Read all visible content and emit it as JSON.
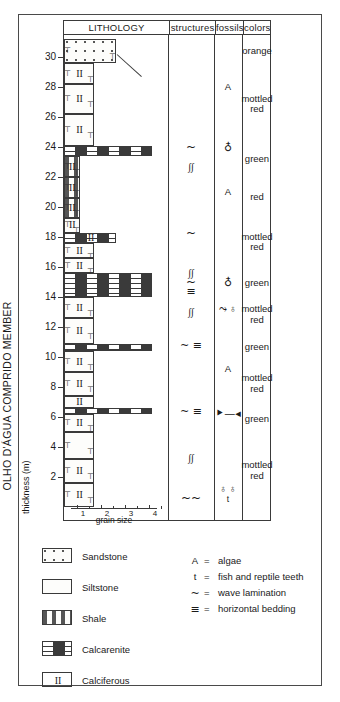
{
  "figure": {
    "member_name": "OLHO D'ÁGUA COMPRIDO MEMBER",
    "axis_title": "thickness (m)"
  },
  "table_headers": [
    {
      "id": "lithology",
      "label": "LITHOLOGY"
    },
    {
      "id": "structures",
      "label": "structures"
    },
    {
      "id": "fossils",
      "label": "fossils"
    },
    {
      "id": "colors",
      "label": "colors"
    }
  ],
  "depth_axis": {
    "unit": "m",
    "ticks": [
      2,
      4,
      6,
      8,
      10,
      12,
      14,
      16,
      18,
      20,
      22,
      24,
      26,
      28,
      30
    ],
    "min": 0,
    "max": 31.5
  },
  "grain_size_scale": {
    "caption": "grain size",
    "ticks": [
      "1",
      "2",
      "3",
      "4"
    ]
  },
  "chart_data": {
    "type": "table",
    "xlabel": "grain size",
    "ylabel": "thickness (m)",
    "ylim": [
      0,
      31.5
    ],
    "lithology_units": [
      {
        "from": 0.0,
        "to": 1.6,
        "lithology": "siltstone",
        "grain": 2,
        "calciferous": true
      },
      {
        "from": 1.6,
        "to": 3.2,
        "lithology": "siltstone",
        "grain": 2,
        "calciferous": true
      },
      {
        "from": 3.2,
        "to": 5.0,
        "lithology": "siltstone",
        "grain": 2,
        "calciferous": false
      },
      {
        "from": 5.0,
        "to": 6.2,
        "lithology": "siltstone",
        "grain": 2,
        "calciferous": true
      },
      {
        "from": 6.2,
        "to": 6.6,
        "lithology": "calcarenite",
        "grain": 4,
        "calciferous": false
      },
      {
        "from": 6.6,
        "to": 7.4,
        "lithology": "siltstone",
        "grain": 2,
        "calciferous": true
      },
      {
        "from": 7.4,
        "to": 9.0,
        "lithology": "siltstone",
        "grain": 2,
        "calciferous": true
      },
      {
        "from": 9.0,
        "to": 10.4,
        "lithology": "siltstone",
        "grain": 2,
        "calciferous": true
      },
      {
        "from": 10.4,
        "to": 10.9,
        "lithology": "calcarenite",
        "grain": 4,
        "calciferous": false
      },
      {
        "from": 10.9,
        "to": 12.6,
        "lithology": "siltstone",
        "grain": 2,
        "calciferous": true
      },
      {
        "from": 12.6,
        "to": 14.0,
        "lithology": "siltstone",
        "grain": 2,
        "calciferous": true
      },
      {
        "from": 14.0,
        "to": 15.6,
        "lithology": "calcarenite",
        "grain": 4,
        "calciferous": false
      },
      {
        "from": 15.6,
        "to": 16.6,
        "lithology": "siltstone",
        "grain": 2,
        "calciferous": true
      },
      {
        "from": 16.6,
        "to": 17.6,
        "lithology": "siltstone",
        "grain": 2,
        "calciferous": true
      },
      {
        "from": 17.6,
        "to": 18.3,
        "lithology": "calcarenite",
        "grain": 3,
        "calciferous": true
      },
      {
        "from": 18.3,
        "to": 19.3,
        "lithology": "siltstone",
        "grain": 1,
        "calciferous": true
      },
      {
        "from": 19.3,
        "to": 20.6,
        "lithology": "shale",
        "grain": 1,
        "calciferous": true
      },
      {
        "from": 20.6,
        "to": 22.0,
        "lithology": "shale",
        "grain": 1,
        "calciferous": true
      },
      {
        "from": 22.0,
        "to": 23.4,
        "lithology": "shale",
        "grain": 1,
        "calciferous": true
      },
      {
        "from": 23.4,
        "to": 24.1,
        "lithology": "calcarenite",
        "grain": 4,
        "calciferous": false
      },
      {
        "from": 24.1,
        "to": 26.2,
        "lithology": "siltstone",
        "grain": 2,
        "calciferous": true
      },
      {
        "from": 26.2,
        "to": 28.2,
        "lithology": "siltstone",
        "grain": 2,
        "calciferous": true
      },
      {
        "from": 28.2,
        "to": 29.6,
        "lithology": "siltstone",
        "grain": 2,
        "calciferous": true
      },
      {
        "from": 29.6,
        "to": 31.2,
        "lithology": "sandstone",
        "grain": 3,
        "calciferous": false
      }
    ],
    "structures": [
      {
        "depth": 24.0,
        "symbol": "~",
        "name": "wave-lamination"
      },
      {
        "depth": 22.7,
        "symbol": "ss",
        "name": "cross-lamination"
      },
      {
        "depth": 18.3,
        "symbol": "~",
        "name": "wave-lamination"
      },
      {
        "depth": 15.6,
        "symbol": "ss",
        "name": "cross-lamination"
      },
      {
        "depth": 15.0,
        "symbol": "~",
        "name": "wave-lamination"
      },
      {
        "depth": 14.4,
        "symbol": "≡",
        "name": "horizontal-bedding"
      },
      {
        "depth": 13.0,
        "symbol": "ss",
        "name": "cross-lamination"
      },
      {
        "depth": 10.8,
        "symbol": "~ ≡",
        "name": "wave-lamination-and-horizontal-bedding"
      },
      {
        "depth": 6.4,
        "symbol": "~ ≡",
        "name": "wave-lamination-and-horizontal-bedding"
      },
      {
        "depth": 3.3,
        "symbol": "ss",
        "name": "cross-lamination"
      },
      {
        "depth": 0.6,
        "symbol": "~~",
        "name": "wave-lamination"
      }
    ],
    "fossils": [
      {
        "depth": 28.0,
        "symbol": "A",
        "name": "algae"
      },
      {
        "depth": 24.0,
        "symbol": "sh",
        "name": "shell"
      },
      {
        "depth": 21.0,
        "symbol": "A",
        "name": "algae"
      },
      {
        "depth": 15.0,
        "symbol": "sh",
        "name": "shell"
      },
      {
        "depth": 13.2,
        "symbol": "bone+shell",
        "name": "bone-and-shell"
      },
      {
        "depth": 9.2,
        "symbol": "A",
        "name": "algae"
      },
      {
        "depth": 6.3,
        "symbol": "bone",
        "name": "bone"
      },
      {
        "depth": 0.9,
        "symbol": "sh+sh+t",
        "name": "shell-shell-teeth"
      }
    ],
    "colors": [
      {
        "from": 29.4,
        "to": 31.5,
        "label": "orange"
      },
      {
        "from": 24.4,
        "to": 29.4,
        "label": "mottled\nred"
      },
      {
        "from": 22.0,
        "to": 24.4,
        "label": "green"
      },
      {
        "from": 19.4,
        "to": 22.0,
        "label": "red"
      },
      {
        "from": 16.0,
        "to": 19.4,
        "label": "mottled\nred"
      },
      {
        "from": 13.9,
        "to": 16.0,
        "label": "green"
      },
      {
        "from": 11.8,
        "to": 13.9,
        "label": "mottled\nred"
      },
      {
        "from": 9.6,
        "to": 11.8,
        "label": "green"
      },
      {
        "from": 6.9,
        "to": 9.6,
        "label": "mottled\nred"
      },
      {
        "from": 4.9,
        "to": 6.9,
        "label": "green"
      },
      {
        "from": 0.0,
        "to": 4.9,
        "label": "mottled\nred"
      }
    ]
  },
  "legend_lithology": [
    {
      "key": "sandstone",
      "label": "Sandstone"
    },
    {
      "key": "siltstone",
      "label": "Siltstone"
    },
    {
      "key": "shale",
      "label": "Shale"
    },
    {
      "key": "calcarenite",
      "label": "Calcarenite"
    },
    {
      "key": "calciferous",
      "label": "Calciferous",
      "glyph": "II"
    }
  ],
  "legend_symbols": [
    {
      "symbol": "A",
      "eq": "=",
      "label": "algae"
    },
    {
      "symbol": "t",
      "eq": "=",
      "label": "fish and reptile teeth"
    },
    {
      "symbol": "~",
      "eq": "=",
      "label": "wave lamination"
    },
    {
      "symbol": "≡",
      "eq": "=",
      "label": "horizontal bedding"
    }
  ],
  "colors": {
    "ink": "#3a3a3a",
    "frame": "#4a4a4a",
    "paper": "#ffffff"
  }
}
